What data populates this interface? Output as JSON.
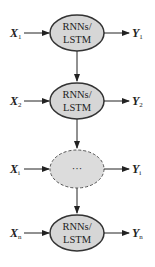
{
  "diagram": {
    "node_fill": "#d6d6d6",
    "node_stroke": "#333333",
    "nodes": [
      {
        "line1": "RNNs/",
        "line2": "LSTM",
        "input": "X",
        "input_sub": "1",
        "output": "Y",
        "output_sub": "1"
      },
      {
        "line1": "RNNs/",
        "line2": "LSTM",
        "input": "X",
        "input_sub": "2",
        "output": "Y",
        "output_sub": "2"
      },
      {
        "ellipsis": "···",
        "input": "X",
        "input_sub": "i",
        "output": "Y",
        "output_sub": "i"
      },
      {
        "line1": "RNNs/",
        "line2": "LSTM",
        "input": "X",
        "input_sub": "n",
        "output": "Y",
        "output_sub": "n"
      }
    ]
  }
}
